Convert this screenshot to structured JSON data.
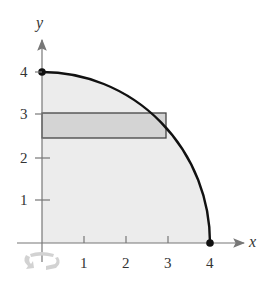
{
  "figure": {
    "type": "region-under-curve",
    "axes": {
      "x_label": "x",
      "y_label": "y",
      "x_ticks": [
        "1",
        "2",
        "3",
        "4"
      ],
      "y_ticks": [
        "1",
        "2",
        "3",
        "4"
      ]
    },
    "curve": {
      "from": [
        0,
        4
      ],
      "to": [
        4,
        0
      ],
      "endpoints_marked": true
    },
    "rectangle": {
      "x_min": 0,
      "x_max": 2.9,
      "y_min": 2.45,
      "y_max": 3.05
    },
    "colors": {
      "region_fill": "#ececec",
      "rectangle_fill": "#d4d4d4",
      "curve": "#111111",
      "axis": "#777777",
      "rotate_icon": "#cfcfcf"
    },
    "icons": {
      "rotate": "rotate-icon"
    }
  }
}
